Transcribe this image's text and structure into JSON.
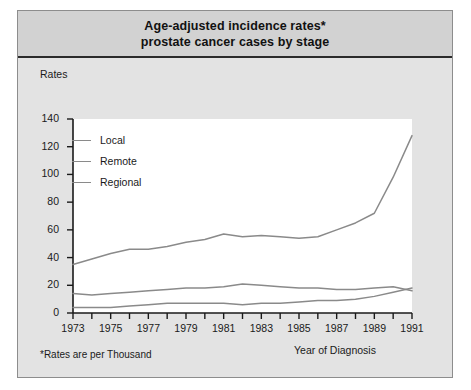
{
  "figure": {
    "title_line1": "Age-adjusted incidence rates*",
    "title_line2": "prostate cancer cases by stage",
    "footnote": "*Rates are per Thousand",
    "background_color": "#e3e3e3",
    "banner_color": "#d2d2d2",
    "plot_color": "#ffffff",
    "line_color": "#8a8a8a",
    "axis_color": "#1a1a1a"
  },
  "chart_data": {
    "type": "line",
    "title": "Age-adjusted incidence rates* prostate cancer cases by stage",
    "xlabel": "Year of Diagnosis",
    "ylabel": "Rates",
    "footnote": "*Rates are per Thousand",
    "grid": false,
    "legend_position": "upper-left-inside",
    "xlim": [
      1973,
      1991
    ],
    "ylim": [
      0,
      140
    ],
    "yticks": [
      0,
      20,
      40,
      60,
      80,
      100,
      120,
      140
    ],
    "ytick_labels": [
      "0",
      "20",
      "40",
      "60",
      "80",
      "100",
      "120",
      "140"
    ],
    "x": [
      1973,
      1974,
      1975,
      1976,
      1977,
      1978,
      1979,
      1980,
      1981,
      1982,
      1983,
      1984,
      1985,
      1986,
      1987,
      1988,
      1989,
      1990,
      1991
    ],
    "xticks": [
      1973,
      1974,
      1975,
      1976,
      1977,
      1978,
      1979,
      1980,
      1981,
      1982,
      1983,
      1984,
      1985,
      1986,
      1987,
      1988,
      1989,
      1990,
      1991
    ],
    "xtick_labels": [
      "1973",
      "",
      "1975",
      "",
      "1977",
      "",
      "1979",
      "",
      "1981",
      "",
      "1983",
      "",
      "1985",
      "",
      "1987",
      "",
      "1989",
      "",
      "1991"
    ],
    "xtick_labels_shown": [
      "1973",
      "1975",
      "1977",
      "1979",
      "1981",
      "1983",
      "1985",
      "1987",
      "1989",
      "1991"
    ],
    "series": [
      {
        "name": "Local",
        "values": [
          35,
          39,
          43,
          46,
          46,
          48,
          51,
          53,
          57,
          55,
          56,
          55,
          54,
          55,
          60,
          65,
          72,
          98,
          128
        ]
      },
      {
        "name": "Remote",
        "values": [
          14,
          13,
          14,
          15,
          16,
          17,
          18,
          18,
          19,
          21,
          20,
          19,
          18,
          18,
          17,
          17,
          18,
          19,
          16
        ]
      },
      {
        "name": "Regional",
        "values": [
          4,
          4,
          4,
          5,
          6,
          7,
          7,
          7,
          7,
          6,
          7,
          7,
          8,
          9,
          9,
          10,
          12,
          15,
          18
        ]
      }
    ]
  }
}
